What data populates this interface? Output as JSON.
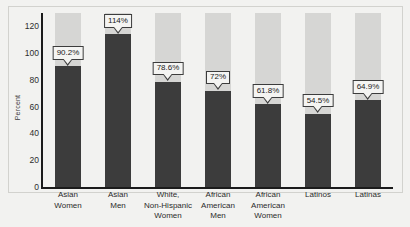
{
  "chart_data": {
    "type": "bar",
    "title": "",
    "subtitle": "",
    "xlabel": "",
    "ylabel": "Percent",
    "ylim": [
      0,
      130
    ],
    "yticks": [
      0,
      20,
      40,
      60,
      80,
      100,
      120
    ],
    "ytick_labels": [
      "0",
      "20",
      "40",
      "60",
      "80",
      "100",
      "120"
    ],
    "grid": false,
    "legend": false,
    "categories": [
      "Asian Women",
      "Asian Men",
      "White, Non-Hispanic Women",
      "African American Men",
      "African American Women",
      "Latinos",
      "Latinas"
    ],
    "category_lines": [
      [
        "Asian",
        "Women"
      ],
      [
        "Asian",
        "Men"
      ],
      [
        "White,",
        "Non-Hispanic",
        "Women"
      ],
      [
        "African",
        "American",
        "Men"
      ],
      [
        "African",
        "American",
        "Women"
      ],
      [
        "Latinos"
      ],
      [
        "Latinas"
      ]
    ],
    "values": [
      90.2,
      114,
      78.6,
      72,
      61.8,
      54.5,
      64.9
    ],
    "value_labels": [
      "90.2%",
      "114%",
      "78.6%",
      "72%",
      "61.8%",
      "54.5%",
      "64.9%"
    ],
    "colors": {
      "bar_fill": "#3c3c3c",
      "bar_background": "#d6d6d4",
      "axis": "#1b1b1b",
      "plot_background": "#f2f2f0",
      "callout_background": "#f4f4f2",
      "callout_border": "#3c3c3c",
      "text": "#2b2b2b"
    }
  }
}
